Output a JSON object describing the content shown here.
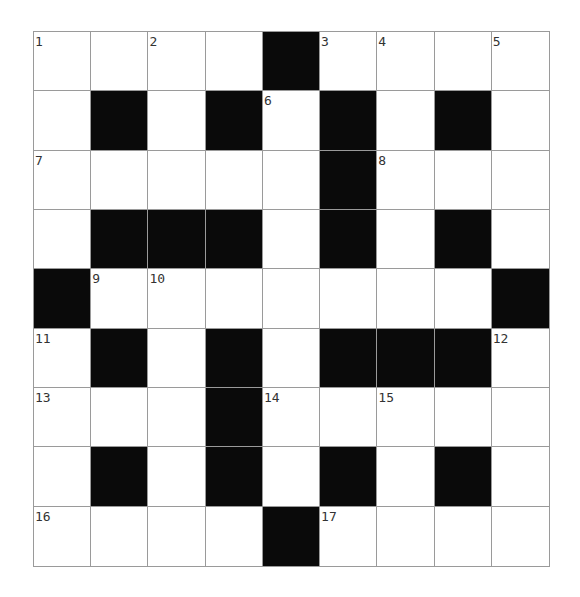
{
  "puzzle": {
    "rows": 9,
    "cols": 9,
    "layout": [
      "..x.#....",
      ".#.#.#.#.",
      ".....#...",
      ".###.#.#.",
      "#.......#",
      ".#.#.###.",
      "...#.....",
      ".#.#.#.#.",
      "....#...."
    ],
    "numbers": [
      {
        "row": 0,
        "col": 0,
        "n": "1"
      },
      {
        "row": 0,
        "col": 2,
        "n": "2"
      },
      {
        "row": 0,
        "col": 5,
        "n": "3"
      },
      {
        "row": 0,
        "col": 6,
        "n": "4"
      },
      {
        "row": 0,
        "col": 8,
        "n": "5"
      },
      {
        "row": 1,
        "col": 4,
        "n": "6"
      },
      {
        "row": 2,
        "col": 0,
        "n": "7"
      },
      {
        "row": 2,
        "col": 6,
        "n": "8"
      },
      {
        "row": 4,
        "col": 1,
        "n": "9"
      },
      {
        "row": 4,
        "col": 2,
        "n": "10"
      },
      {
        "row": 5,
        "col": 0,
        "n": "11"
      },
      {
        "row": 5,
        "col": 8,
        "n": "12"
      },
      {
        "row": 6,
        "col": 0,
        "n": "13"
      },
      {
        "row": 6,
        "col": 4,
        "n": "14"
      },
      {
        "row": 6,
        "col": 6,
        "n": "15"
      },
      {
        "row": 8,
        "col": 0,
        "n": "16"
      },
      {
        "row": 8,
        "col": 5,
        "n": "17"
      }
    ],
    "colors": {
      "block": "#0a0a0a",
      "cell": "#ffffff",
      "gridline": "#9a9a9a",
      "number": "#333333"
    }
  }
}
